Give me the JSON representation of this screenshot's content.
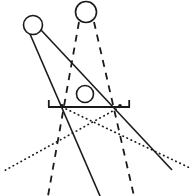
{
  "figure": {
    "kind": "line-diagram",
    "canvas": {
      "width": 192,
      "height": 196,
      "background": "#ffffff"
    },
    "stroke_color": "#1a1a1a",
    "objects": {
      "left_circle": {
        "name": "upper-left-circle",
        "cx": 33,
        "cy": 25,
        "r": 9.5,
        "stroke_width": 1.6
      },
      "top_circle": {
        "name": "upper-right-circle",
        "cx": 86,
        "cy": 12,
        "r": 10.5,
        "stroke_width": 1.6
      },
      "mid_circle": {
        "name": "center-circle",
        "cx": 85,
        "cy": 94,
        "r": 8.5,
        "stroke_width": 1.6
      }
    },
    "baseline": {
      "name": "horizontal-baseline",
      "x1": 48,
      "x2": 130,
      "y": 107,
      "stroke_width": 1.8,
      "left_tick": {
        "x": 48,
        "y_top": 100,
        "y_bottom": 107
      },
      "right_tick": {
        "x": 130,
        "y_top": 100,
        "y_bottom": 107
      }
    },
    "vertices": {
      "left": {
        "name": "left-vertex",
        "x": 62,
        "y": 107
      },
      "right": {
        "name": "right-vertex",
        "x": 120,
        "y": 107
      }
    },
    "solid_lines": [
      {
        "name": "ray-left-circle-to-bottom",
        "x1": 30,
        "y1": 34,
        "x2": 100,
        "y2": 196,
        "stroke_width": 1.6
      },
      {
        "name": "ray-left-circle-to-right-exit",
        "x1": 41,
        "y1": 30,
        "x2": 172,
        "y2": 170,
        "stroke_width": 1.6
      }
    ],
    "dashed_lines": [
      {
        "name": "dashed-ray-left",
        "x1": 79,
        "y1": 22,
        "x2": 48,
        "y2": 196,
        "stroke_width": 1.8,
        "dash": "7 6"
      },
      {
        "name": "dashed-ray-right",
        "x1": 94,
        "y1": 22,
        "x2": 134,
        "y2": 196,
        "stroke_width": 1.8,
        "dash": "7 6"
      }
    ],
    "dotted_lines": [
      {
        "name": "dotted-ray-left-vertex-outward",
        "x1": 120,
        "y1": 107,
        "x2": 2,
        "y2": 172,
        "stroke_width": 1.7,
        "dash": "0.5 4"
      },
      {
        "name": "dotted-ray-right-vertex-outward",
        "x1": 62,
        "y1": 107,
        "x2": 190,
        "y2": 168,
        "stroke_width": 1.7,
        "dash": "0.5 4"
      }
    ],
    "labels": []
  }
}
